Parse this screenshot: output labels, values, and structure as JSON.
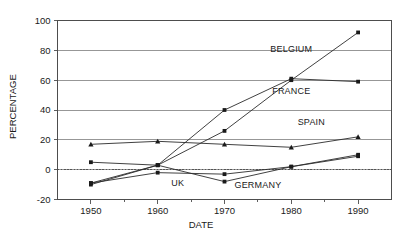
{
  "chart_data": {
    "type": "line",
    "title": "",
    "xlabel": "DATE",
    "ylabel": "PERCENTAGE",
    "x": [
      1950,
      1960,
      1970,
      1980,
      1990
    ],
    "xlim": [
      1945,
      1995
    ],
    "ylim": [
      -20,
      100
    ],
    "yticks": [
      -20,
      0,
      20,
      40,
      60,
      80,
      100
    ],
    "xticks": [
      1950,
      1960,
      1970,
      1980,
      1990
    ],
    "x_minor_ticks": [
      1955,
      1965,
      1975,
      1985
    ],
    "grid": "horizontal",
    "zero_reference_line": true,
    "legend_position": "inline-annotations",
    "series": [
      {
        "name": "BELGIUM",
        "marker": "square",
        "values": [
          -9,
          3,
          26,
          60,
          92
        ],
        "label_x": 1980,
        "label_y": 79
      },
      {
        "name": "FRANCE",
        "marker": "square",
        "values": [
          -10,
          3,
          40,
          61,
          59
        ],
        "label_x": 1980,
        "label_y": 51
      },
      {
        "name": "SPAIN",
        "marker": "triangle",
        "values": [
          17,
          19,
          17,
          15,
          22
        ],
        "label_x": 1983,
        "label_y": 30
      },
      {
        "name": "UK",
        "marker": "square",
        "values": [
          -9,
          -2,
          -3,
          2,
          10
        ],
        "label_x": 1963,
        "label_y": -11
      },
      {
        "name": "GERMANY",
        "marker": "square",
        "values": [
          5,
          3,
          -8,
          2,
          9
        ],
        "label_x": 1975,
        "label_y": -12
      }
    ],
    "ytick_labels": [
      "-20",
      "0",
      "20",
      "40",
      "60",
      "80",
      "100"
    ],
    "xtick_labels": [
      "1950",
      "1960",
      "1970",
      "1980",
      "1990"
    ]
  }
}
